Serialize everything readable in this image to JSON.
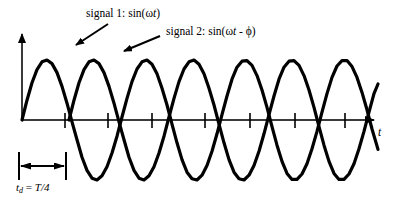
{
  "figure": {
    "title": "",
    "axis_label_t": "t",
    "delay_label_prefix": "t",
    "delay_label_sub": "d",
    "delay_label_rest": " = ",
    "delay_label_value": "T/4",
    "signal1": {
      "prefix": "signal 1: sin(",
      "omega": "ω",
      "var": "t",
      "suffix": ")"
    },
    "signal2": {
      "prefix": "signal 2: sin(",
      "omega": "ω",
      "var": "t",
      "minus": " - ",
      "phi": "ϕ",
      "suffix": ")"
    },
    "colors": {
      "curve": "#000000",
      "axis": "#3a3a3a",
      "background": "#ffffff",
      "text": "#000000"
    }
  },
  "chart_data": {
    "type": "line",
    "title": "",
    "xlabel": "t",
    "ylabel": "",
    "grid": false,
    "legend": "annotations",
    "axis": {
      "origin_x": 22,
      "baseline_y": 120,
      "x_start": 22,
      "x_end": 378,
      "y_top": 28,
      "amplitude": 60,
      "period_px": 95
    },
    "xticks": [
      65,
      108,
      152,
      205,
      250,
      295,
      345
    ],
    "annotations": [
      {
        "text": "signal 1: sin(ωt)",
        "points_to_x": 72,
        "points_to_y": 46
      },
      {
        "text": "signal 2: sin(ωt - ϕ)",
        "points_to_x": 118,
        "points_to_y": 52
      },
      {
        "text": "t_d = T/4",
        "span_from_x": 19,
        "span_to_x": 66,
        "y": 166
      }
    ],
    "series": [
      {
        "name": "signal 1: sin(ωt)",
        "formula": "sin(ωt)",
        "phase_shift_px": 0,
        "color": "#000000",
        "x": [
          22,
          27,
          32,
          37,
          42,
          47,
          52,
          57,
          62,
          67,
          72,
          77,
          82,
          87,
          92,
          97,
          102,
          107,
          112,
          117,
          122,
          127,
          132,
          137,
          142,
          147,
          152,
          157,
          162,
          167,
          172,
          177,
          182,
          187,
          192,
          197,
          202,
          207,
          212,
          217,
          222,
          227,
          232,
          237,
          242,
          247,
          252,
          257,
          262,
          267,
          272,
          277,
          282,
          287,
          292,
          297,
          302,
          307,
          312,
          317,
          322,
          327,
          332,
          337,
          342,
          347,
          352,
          357,
          362,
          367,
          372,
          378
        ],
        "y_normalized": [
          0.0,
          0.33,
          0.62,
          0.84,
          0.97,
          1.0,
          0.94,
          0.79,
          0.56,
          0.28,
          -0.03,
          -0.33,
          -0.62,
          -0.84,
          -0.97,
          -1.0,
          -0.93,
          -0.78,
          -0.55,
          -0.27,
          0.05,
          0.36,
          0.64,
          0.85,
          0.97,
          1.0,
          0.93,
          0.77,
          0.53,
          0.25,
          -0.07,
          -0.38,
          -0.66,
          -0.87,
          -0.98,
          -1.0,
          -0.92,
          -0.76,
          -0.52,
          -0.23,
          0.09,
          0.4,
          0.68,
          0.88,
          0.98,
          0.99,
          0.91,
          0.74,
          0.5,
          0.21,
          -0.11,
          -0.42,
          -0.69,
          -0.89,
          -0.99,
          -0.99,
          -0.9,
          -0.73,
          -0.48,
          -0.19,
          0.13,
          0.44,
          0.71,
          0.9,
          0.99,
          0.99,
          0.89,
          0.71,
          0.46,
          0.17,
          -0.15,
          -0.49
        ]
      },
      {
        "name": "signal 2: sin(ωt - ϕ)",
        "formula": "sin(ωt - ϕ)",
        "phase_shift_px": 47,
        "color": "#000000",
        "x": [
          69,
          74,
          79,
          84,
          89,
          94,
          99,
          104,
          109,
          114,
          119,
          124,
          129,
          134,
          139,
          144,
          149,
          154,
          159,
          164,
          169,
          174,
          179,
          184,
          189,
          194,
          199,
          204,
          209,
          214,
          219,
          224,
          229,
          234,
          239,
          244,
          249,
          254,
          259,
          264,
          269,
          274,
          279,
          284,
          289,
          294,
          299,
          304,
          309,
          314,
          319,
          324,
          329,
          334,
          339,
          344,
          349,
          354,
          359,
          364,
          369,
          374,
          378
        ],
        "y_normalized": [
          0.0,
          0.33,
          0.62,
          0.84,
          0.97,
          1.0,
          0.94,
          0.79,
          0.56,
          0.28,
          -0.03,
          -0.33,
          -0.62,
          -0.84,
          -0.97,
          -1.0,
          -0.93,
          -0.78,
          -0.55,
          -0.27,
          0.05,
          0.36,
          0.64,
          0.85,
          0.97,
          1.0,
          0.93,
          0.77,
          0.53,
          0.25,
          -0.07,
          -0.38,
          -0.66,
          -0.87,
          -0.98,
          -1.0,
          -0.92,
          -0.76,
          -0.52,
          -0.23,
          0.09,
          0.4,
          0.68,
          0.88,
          0.98,
          0.99,
          0.91,
          0.74,
          0.5,
          0.21,
          -0.11,
          -0.42,
          -0.69,
          -0.89,
          -0.99,
          -0.99,
          -0.9,
          -0.73,
          -0.48,
          -0.19,
          0.13,
          0.44,
          0.6
        ]
      }
    ]
  }
}
